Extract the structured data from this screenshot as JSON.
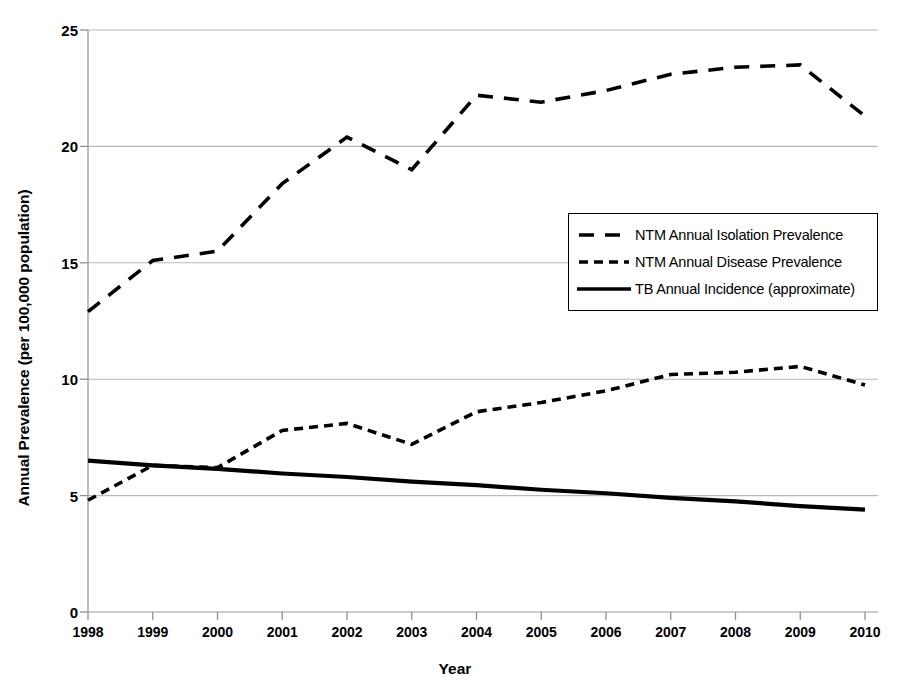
{
  "chart_data": {
    "type": "line",
    "title": "",
    "xlabel": "Year",
    "ylabel": "Annual Prevalence (per 100,000 population)",
    "xlim": [
      1998,
      2010
    ],
    "ylim": [
      0,
      25
    ],
    "ytick_labels": [
      "0",
      "5",
      "10",
      "15",
      "20",
      "25"
    ],
    "ytick_values": [
      0,
      5,
      10,
      15,
      20,
      25
    ],
    "grid": "horizontal",
    "legend_position": "center-right",
    "categories": [
      "1998",
      "1999",
      "2000",
      "2001",
      "2002",
      "2003",
      "2004",
      "2005",
      "2006",
      "2007",
      "2008",
      "2009",
      "2010"
    ],
    "x": [
      1998,
      1999,
      2000,
      2001,
      2002,
      2003,
      2004,
      2005,
      2006,
      2007,
      2008,
      2009,
      2010
    ],
    "series": [
      {
        "name": "NTM Annual Isolation Prevalence",
        "style": "long-dashed",
        "color": "#000000",
        "values": [
          12.9,
          15.1,
          15.5,
          18.4,
          20.4,
          19.0,
          22.2,
          21.9,
          22.4,
          23.1,
          23.4,
          23.5,
          21.3
        ]
      },
      {
        "name": "NTM Annual Disease Prevalence",
        "style": "short-dashed",
        "color": "#000000",
        "values": [
          4.8,
          6.3,
          6.2,
          7.8,
          8.1,
          7.2,
          8.6,
          9.0,
          9.5,
          10.2,
          10.3,
          10.55,
          9.75
        ]
      },
      {
        "name": "TB Annual Incidence (approximate)",
        "style": "solid",
        "color": "#000000",
        "values": [
          6.5,
          6.3,
          6.15,
          5.95,
          5.8,
          5.6,
          5.45,
          5.25,
          5.1,
          4.9,
          4.75,
          4.55,
          4.4
        ]
      }
    ]
  },
  "legend": {
    "entries": [
      {
        "label": "NTM Annual Isolation Prevalence",
        "style": "long-dashed"
      },
      {
        "label": "NTM Annual Disease Prevalence",
        "style": "short-dashed"
      },
      {
        "label": "TB Annual Incidence (approximate)",
        "style": "solid"
      }
    ]
  }
}
